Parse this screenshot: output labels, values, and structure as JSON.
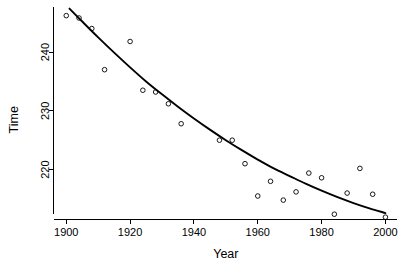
{
  "chart_data": {
    "type": "scatter",
    "title": "",
    "xlabel": "Year",
    "ylabel": "Time",
    "xlim": [
      1896,
      2003
    ],
    "ylim": [
      211.5,
      247.5
    ],
    "xticks": [
      1900,
      1920,
      1940,
      1960,
      1980,
      2000
    ],
    "xtick_labels": [
      "1900",
      "1920",
      "1940",
      "1960",
      "1980",
      "2000"
    ],
    "yticks": [
      220,
      230,
      240
    ],
    "ytick_labels": [
      "220",
      "230",
      "240"
    ],
    "grid": false,
    "legend": null,
    "marker": "open-circle",
    "series": [
      {
        "name": "Time",
        "x": [
          1900,
          1904,
          1908,
          1912,
          1920,
          1924,
          1928,
          1932,
          1936,
          1948,
          1952,
          1956,
          1960,
          1964,
          1968,
          1972,
          1976,
          1980,
          1984,
          1988,
          1992,
          1996,
          2000
        ],
        "y": [
          246.2,
          245.8,
          244.0,
          237.0,
          241.8,
          233.5,
          233.2,
          231.2,
          227.8,
          225.0,
          225.0,
          221.0,
          215.5,
          218.0,
          214.8,
          216.2,
          219.4,
          218.6,
          212.4,
          216.0,
          220.2,
          215.8,
          211.9
        ]
      }
    ],
    "fit_curve": {
      "name": "exponential decay fit",
      "x": [
        1901,
        1905,
        1910,
        1915,
        1920,
        1925,
        1930,
        1935,
        1940,
        1945,
        1950,
        1955,
        1960,
        1965,
        1970,
        1975,
        1980,
        1985,
        1990,
        1995,
        2000
      ],
      "y": [
        247.4,
        245.2,
        242.5,
        239.9,
        237.4,
        235.0,
        232.8,
        230.7,
        228.7,
        226.8,
        225.0,
        223.3,
        221.7,
        220.2,
        218.9,
        217.6,
        216.4,
        215.3,
        214.3,
        213.4,
        212.6
      ]
    }
  },
  "axes": {
    "x_title": "Year",
    "y_title": "Time"
  }
}
